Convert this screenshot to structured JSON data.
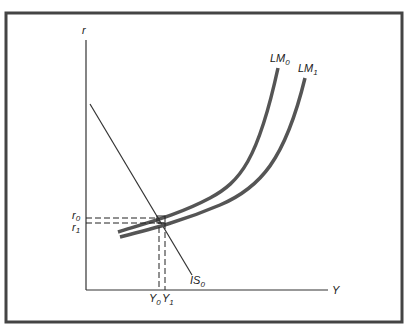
{
  "figure": {
    "axes": {
      "x_label": "Y",
      "y_label": "r"
    },
    "curves": {
      "lm0": {
        "name": "LM",
        "sub": "0"
      },
      "lm1": {
        "name": "LM",
        "sub": "1"
      },
      "is0": {
        "name": "IS",
        "sub": "0"
      }
    },
    "levels": {
      "r0": {
        "name": "r",
        "sub": "0"
      },
      "r1": {
        "name": "r",
        "sub": "1"
      },
      "y0": {
        "name": "Y",
        "sub": "0"
      },
      "y1": {
        "name": "Y",
        "sub": "1"
      }
    },
    "colors": {
      "curve": "#555555",
      "line": "#333333",
      "frame": "#444444"
    }
  }
}
